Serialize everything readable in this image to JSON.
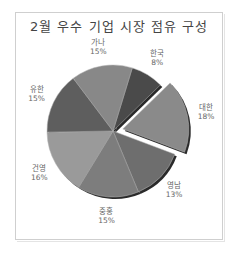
{
  "header_text": "그래프 제목 변경 · 데이터 레이블 · 원형 조각 분리",
  "chart_data": {
    "type": "pie",
    "title": "2월 우수 기업 시장 점유 구성",
    "start_angle_deg": 17,
    "direction": "clockwise",
    "exploded": [
      "대한"
    ],
    "slices": [
      {
        "label": "한국",
        "value": 8,
        "display": "8%",
        "color": "#4a4a4a"
      },
      {
        "label": "대한",
        "value": 18,
        "display": "18%",
        "color": "#8a8a8a"
      },
      {
        "label": "영남",
        "value": 13,
        "display": "13%",
        "color": "#6e6e6e"
      },
      {
        "label": "중홍",
        "value": 15,
        "display": "15%",
        "color": "#7d7d7d"
      },
      {
        "label": "건영",
        "value": 16,
        "display": "16%",
        "color": "#9a9a9a"
      },
      {
        "label": "유한",
        "value": 15,
        "display": "15%",
        "color": "#5e5e5e"
      },
      {
        "label": "가나",
        "value": 15,
        "display": "15%",
        "color": "#888888"
      }
    ],
    "legend": "none",
    "data_labels": "category name and percentage"
  }
}
